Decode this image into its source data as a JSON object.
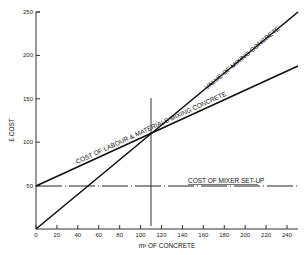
{
  "chart_data": {
    "type": "line",
    "title": "",
    "xlabel": "m³ OF CONCRETE",
    "ylabel": "£ COST",
    "xlim": [
      0,
      250
    ],
    "ylim": [
      0,
      250
    ],
    "x_ticks": [
      0,
      20,
      40,
      60,
      80,
      100,
      120,
      140,
      160,
      180,
      200,
      220,
      240
    ],
    "y_ticks": [
      50,
      100,
      150,
      200,
      250
    ],
    "grid": false,
    "legend": "none (inline line labels)",
    "series": [
      {
        "name": "VALUE OF MIXING CONCRETE",
        "x": [
          0,
          250
        ],
        "y": [
          0,
          250
        ],
        "style": "solid"
      },
      {
        "name": "COST OF LABOUR & MATERIALS MIXING CONCRETE",
        "x": [
          0,
          250
        ],
        "y": [
          50,
          188
        ],
        "style": "solid"
      },
      {
        "name": "COST OF MIXER SET-UP",
        "x": [
          0,
          250
        ],
        "y": [
          50,
          50
        ],
        "style": "dashed"
      }
    ],
    "annotations": [
      {
        "type": "vline",
        "x": 110,
        "y_range": [
          0,
          150
        ],
        "note": "break-even point at ~110 m³"
      }
    ]
  },
  "labels": {
    "ylabel": "£ COST",
    "xlabel": "m³ OF CONCRETE",
    "value_line": "VALUE OF MIXING CONCRETE",
    "labour_line": "COST OF LABOUR & MATERIALS MIXING CONCRETE",
    "setup_line": "COST OF MIXER SET-UP"
  },
  "ticks": {
    "x": [
      "0",
      "20",
      "40",
      "60",
      "80",
      "100",
      "120",
      "140",
      "160",
      "180",
      "200",
      "220",
      "240"
    ],
    "y": [
      "50",
      "100",
      "150",
      "200",
      "250"
    ]
  }
}
